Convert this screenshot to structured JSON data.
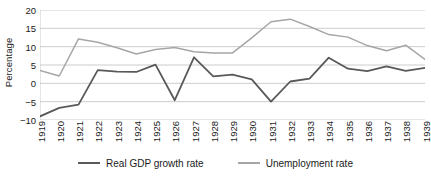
{
  "chart_data": {
    "type": "line",
    "title": "",
    "xlabel": "",
    "ylabel": "Percentage",
    "ylim": [
      -10,
      20
    ],
    "yticks": [
      20,
      15,
      10,
      5,
      0,
      -5,
      -10
    ],
    "grid": true,
    "legend_position": "bottom",
    "categories": [
      "1919",
      "1920",
      "1921",
      "1922",
      "1923",
      "1924",
      "1925",
      "1926",
      "1927",
      "1928",
      "1929",
      "1930",
      "1931",
      "1932",
      "1933",
      "1934",
      "1935",
      "1936",
      "1937",
      "1938",
      "1939"
    ],
    "series": [
      {
        "name": "Real GDP growth rate",
        "color": "#595959",
        "values": [
          -9.0,
          -6.7,
          -5.8,
          3.6,
          3.2,
          3.1,
          5.1,
          -4.6,
          7.1,
          1.9,
          2.4,
          1.1,
          -5.0,
          0.5,
          1.3,
          7.0,
          4.0,
          3.3,
          4.6,
          3.4,
          4.2
        ]
      },
      {
        "name": "Unemployment rate",
        "color": "#a6a6a6",
        "values": [
          3.5,
          2.0,
          12.1,
          11.2,
          9.7,
          8.0,
          9.2,
          9.8,
          8.6,
          8.3,
          8.3,
          12.4,
          16.8,
          17.5,
          15.5,
          13.3,
          12.6,
          10.3,
          8.9,
          10.4,
          6.5
        ]
      }
    ]
  },
  "legend": {
    "items": [
      {
        "label": "Real GDP growth rate",
        "color": "#595959"
      },
      {
        "label": "Unemployment rate",
        "color": "#a6a6a6"
      }
    ]
  },
  "axes": {
    "y_title": "Percentage"
  }
}
